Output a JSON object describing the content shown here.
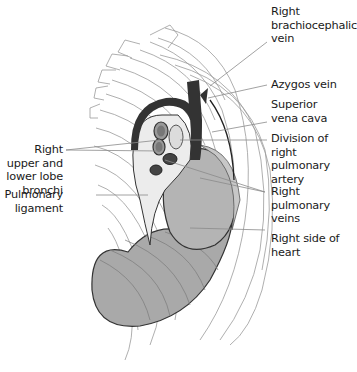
{
  "figure": {
    "colors": {
      "rib_line": "#9a9a9a",
      "lung_fill": "#a9a9a9",
      "heart_fill": "#b4b4b4",
      "vessel_dark": "#333333",
      "leader_line": "#8a8a8a",
      "text": "#1a1a1a"
    }
  },
  "labels": {
    "right": [
      {
        "id": "brachiocephalic",
        "text": "Right\nbrachiocephalic\nvein"
      },
      {
        "id": "azygos",
        "text": "Azygos vein"
      },
      {
        "id": "svc",
        "text": "Superior\nvena cava"
      },
      {
        "id": "pulm_artery",
        "text": "Division of right\npulmonary artery"
      },
      {
        "id": "pulm_veins",
        "text": "Right pulmonary\nveins"
      },
      {
        "id": "heart",
        "text": "Right side of\nheart"
      }
    ],
    "left": [
      {
        "id": "bronchi",
        "text": "Right\nupper and\nlower lobe\nbronchi"
      },
      {
        "id": "ligament",
        "text": "Pulmonary\nligament"
      }
    ]
  }
}
